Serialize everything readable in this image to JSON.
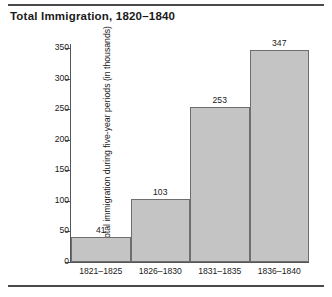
{
  "chart_data": {
    "type": "bar",
    "title": "Total Immigration, 1820–1840",
    "xlabel": "",
    "ylabel": "Total immigration during five-year periods (in thousands)",
    "categories": [
      "1821–1825",
      "1826–1830",
      "1831–1835",
      "1836–1840"
    ],
    "values": [
      41,
      103,
      253,
      347
    ],
    "value_labels": [
      "41",
      "103",
      "253",
      "347"
    ],
    "ylim": [
      0,
      350
    ],
    "ytick_values": [
      0,
      50,
      100,
      150,
      200,
      250,
      300,
      350
    ],
    "yticks": [
      "0",
      "50",
      "100",
      "150",
      "200",
      "250",
      "300",
      "350"
    ],
    "grid": false,
    "legend": null,
    "bar_fill_color": "#c4c4c4",
    "bar_border_color": "#6e6e6e",
    "axis_color": "#555555",
    "rule_color": "#4a4a4a",
    "background_color": "#ffffff"
  }
}
